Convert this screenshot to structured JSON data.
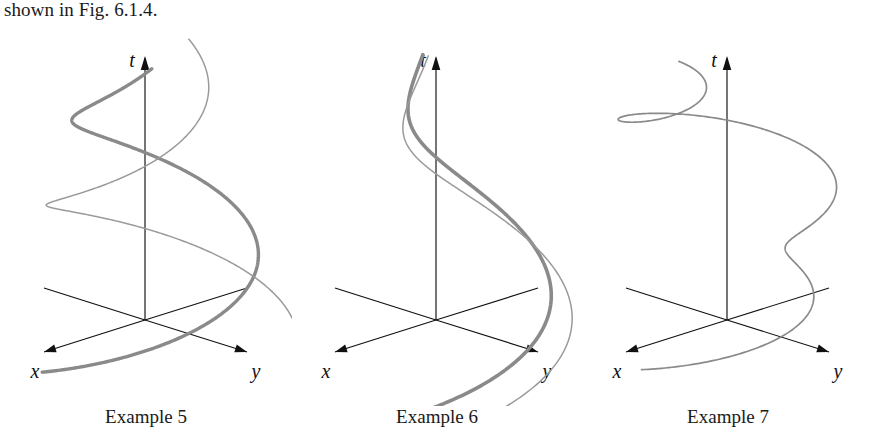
{
  "lead_text": "shown in Fig. 6.1.4.",
  "figure": {
    "background": "#ffffff",
    "axis_color": "#111111",
    "curve_color": "#8a8a8a",
    "curve_color_light": "#9a9a9a"
  },
  "axes": {
    "t_label": "t",
    "x_label": "x",
    "y_label": "y",
    "origin": [
      145,
      294
    ],
    "t_top": [
      145,
      30
    ],
    "x_end": [
      44,
      326
    ],
    "y_end": [
      247,
      326
    ],
    "x_neg_end": [
      247,
      262
    ],
    "y_neg_end": [
      44,
      262
    ]
  },
  "panels": [
    {
      "id": "example-5",
      "caption": "Example 5",
      "description": "Unstable spiral: trajectories wind around the t-axis with amplitude growing as t decreases toward the xy-plane."
    },
    {
      "id": "example-6",
      "caption": "Example 6",
      "description": "Stable spiral: trajectories wind around the t-axis with amplitude decaying as t increases."
    },
    {
      "id": "example-7",
      "caption": "Example 7",
      "description": "Single trajectory spiralling upward with small inner loops on each revolution."
    }
  ],
  "chart_data": {
    "type": "line",
    "xlabel": "x",
    "ylabel": "y",
    "zlabel": "t",
    "grid": false,
    "legend": false,
    "projection": {
      "x_axis_screen_direction": [
        -1.0,
        0.317
      ],
      "y_axis_screen_direction": [
        1.0,
        0.317
      ],
      "t_axis_screen_direction": [
        0.0,
        -1.0
      ],
      "x_unit_px": 101,
      "y_unit_px": 102,
      "t_unit_px": 264
    },
    "panels": [
      {
        "name": "Example 5",
        "type": "parametric-3d",
        "curves": [
          {
            "name": "thick-trajectory",
            "stroke_width": 3.4,
            "color": "#8a8a8a",
            "form": "x = A*e^(-a*t)*cos(w*t + p), y = A*e^(-a*t)*sin(w*t + p), z = t",
            "A": 1.02,
            "a": 0.92,
            "w": 6.6,
            "p": 0.45,
            "t_range": [
              -0.06,
              1.02
            ],
            "samples": 420
          },
          {
            "name": "thin-trajectory",
            "stroke_width": 1.5,
            "color": "#9a9a9a",
            "form": "x = A*e^(-a*t)*cos(w*t + p), y = A*e^(-a*t)*sin(w*t + p), z = t",
            "A": 1.02,
            "a": 0.92,
            "w": 6.6,
            "p": 2.6,
            "t_range": [
              -0.06,
              1.02
            ],
            "samples": 420
          }
        ]
      },
      {
        "name": "Example 6",
        "type": "parametric-3d",
        "curves": [
          {
            "name": "thick-trajectory",
            "stroke_width": 3.6,
            "color": "#8a8a8a",
            "form": "x = A*e^(-a*t)*cos(w*t + p), y = A*e^(-a*t)*sin(w*t + p), z = t",
            "A": 1.25,
            "a": 2.25,
            "w": 5.0,
            "p": 1.15,
            "t_range": [
              -0.13,
              1.02
            ],
            "samples": 420
          },
          {
            "name": "thin-trajectory",
            "stroke_width": 1.5,
            "color": "#9a9a9a",
            "form": "x = A*e^(-a*t)*cos(w*t + p), y = A*e^(-a*t)*sin(w*t + p), z = t",
            "A": 1.25,
            "a": 2.25,
            "w": 5.0,
            "p": 1.52,
            "t_range": [
              -0.13,
              1.02
            ],
            "samples": 420
          }
        ]
      },
      {
        "name": "Example 7",
        "type": "parametric-3d",
        "curves": [
          {
            "name": "looping-trajectory",
            "stroke_width": 1.7,
            "color": "#8a8a8a",
            "form": "epitrochoid-like: x = R*e^(-a*t)*cos(w*t) + r*cos(k*w*t), y = R*e^(-a*t)*sin(w*t) + r*sin(k*w*t), z = t",
            "R": 0.92,
            "a": 0.62,
            "w": 6.4,
            "r": 0.34,
            "k": 2.55,
            "p": 0.2,
            "t_range": [
              0.0,
              1.0
            ],
            "samples": 460
          }
        ]
      }
    ]
  }
}
